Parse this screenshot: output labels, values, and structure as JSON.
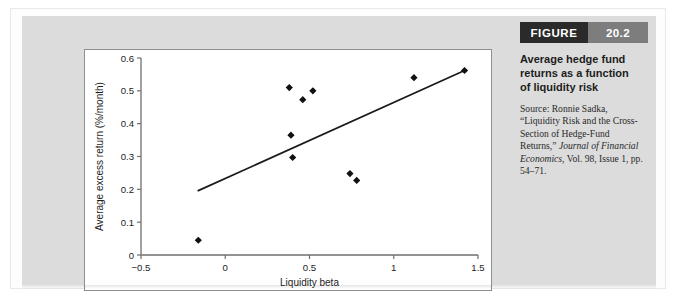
{
  "figure": {
    "header_label": "FIGURE",
    "header_number": "20.2",
    "title": "Average hedge fund returns as a function of liquidity risk",
    "source_prefix": "Source: Ronnie Sadka, “Liquidity Risk and the Cross-Section of Hedge-Fund Returns,” ",
    "source_journal": "Journal of Financial Economics",
    "source_suffix": ", Vol. 98, Issue 1, pp. 54–71."
  },
  "colors": {
    "header_dark": "#2a2a2a",
    "header_gray": "#7d7d7d",
    "panel_gray": "#dcdcdc",
    "marker": "#111111",
    "trendline": "#1a1a1a",
    "axis": "#6f6f6f"
  },
  "chart_data": {
    "type": "scatter",
    "title": "",
    "xlabel": "Liquidity beta",
    "ylabel": "Average excess return (%/month)",
    "xlim": [
      -0.5,
      1.5
    ],
    "ylim": [
      0,
      0.6
    ],
    "xticks": [
      -0.5,
      0,
      0.5,
      1,
      1.5
    ],
    "xticklabels": [
      "−0.5",
      "0",
      "0.5",
      "1",
      "1.5"
    ],
    "yticks": [
      0,
      0.1,
      0.2,
      0.3,
      0.4,
      0.5,
      0.6
    ],
    "yticklabels": [
      "0",
      "0.1",
      "0.2",
      "0.3",
      "0.4",
      "0.5",
      "0.6"
    ],
    "grid": false,
    "legend": null,
    "marker_style": "filled-diamond",
    "points": [
      {
        "x": -0.16,
        "y": 0.045
      },
      {
        "x": 0.38,
        "y": 0.51
      },
      {
        "x": 0.39,
        "y": 0.365
      },
      {
        "x": 0.4,
        "y": 0.297
      },
      {
        "x": 0.46,
        "y": 0.473
      },
      {
        "x": 0.52,
        "y": 0.5
      },
      {
        "x": 0.74,
        "y": 0.248
      },
      {
        "x": 0.78,
        "y": 0.227
      },
      {
        "x": 1.12,
        "y": 0.54
      },
      {
        "x": 1.42,
        "y": 0.562
      }
    ],
    "series": [
      {
        "name": "Hedge fund style portfolios",
        "x": [
          -0.16,
          0.38,
          0.39,
          0.4,
          0.46,
          0.52,
          0.74,
          0.78,
          1.12,
          1.42
        ],
        "values": [
          0.045,
          0.51,
          0.365,
          0.297,
          0.473,
          0.5,
          0.248,
          0.227,
          0.54,
          0.562
        ]
      }
    ],
    "trendline": {
      "type": "linear",
      "x_start": -0.16,
      "y_start": 0.196,
      "x_end": 1.42,
      "y_end": 0.562,
      "slope": 0.232,
      "intercept": 0.233
    }
  }
}
